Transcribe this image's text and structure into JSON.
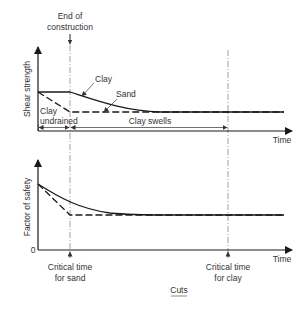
{
  "diagram": {
    "caption": "Cuts",
    "end_of_construction": [
      "End of",
      "construction"
    ],
    "top_chart": {
      "y_axis_label": "Shear strength",
      "x_axis_label": "Time",
      "curve_clay": "Clay",
      "curve_sand": "Sand",
      "region_left": [
        "Clay",
        "undrained"
      ],
      "region_right": "Clay swells"
    },
    "bottom_chart": {
      "y_axis_label": "Factor of safety",
      "x_axis_label": "Time",
      "origin_label": "0",
      "marker_sand": [
        "Critical time",
        "for sand"
      ],
      "marker_clay": [
        "Critical time",
        "for clay"
      ]
    },
    "colors": {
      "line": "#1a1a1a",
      "guide": "#888888",
      "text": "#333333"
    }
  }
}
